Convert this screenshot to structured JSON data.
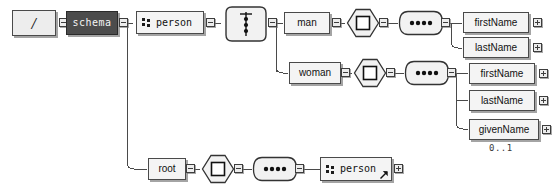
{
  "diagram": {
    "type": "xml-schema-tree",
    "background": "#ffffff",
    "line_color": "#4a4a4a",
    "node_fill": "#f2f2f2",
    "schema_fill": "#4c4c4c",
    "schema_text": "#f4f4f4"
  },
  "nodes": {
    "root": {
      "label": "/",
      "kind": "document-root"
    },
    "schema": {
      "label": "schema",
      "kind": "schema"
    },
    "person_top": {
      "label": "person",
      "kind": "element",
      "icon": "complex-type-icon"
    },
    "choice": {
      "label": "",
      "kind": "choice-compositor"
    },
    "man": {
      "label": "man",
      "kind": "element"
    },
    "woman": {
      "label": "woman",
      "kind": "element"
    },
    "all_man": {
      "label": "",
      "kind": "all-compositor"
    },
    "all_woman": {
      "label": "",
      "kind": "all-compositor"
    },
    "seq_man": {
      "label": "",
      "kind": "sequence-compositor"
    },
    "seq_woman": {
      "label": "",
      "kind": "sequence-compositor"
    },
    "man_firstName": {
      "label": "firstName",
      "kind": "element"
    },
    "man_lastName": {
      "label": "lastName",
      "kind": "element"
    },
    "woman_firstName": {
      "label": "firstName",
      "kind": "element"
    },
    "woman_lastName": {
      "label": "lastName",
      "kind": "element"
    },
    "woman_givenName": {
      "label": "givenName",
      "kind": "element",
      "cardinality": "0..1"
    },
    "root_elem": {
      "label": "root",
      "kind": "element"
    },
    "all_root": {
      "label": "",
      "kind": "all-compositor"
    },
    "seq_root": {
      "label": "",
      "kind": "sequence-compositor"
    },
    "person_ref": {
      "label": "person",
      "kind": "element-reference",
      "icon": "complex-type-icon",
      "badge": "reference-arrow-icon"
    }
  },
  "cardinalities": {
    "woman_givenName": "0..1"
  }
}
